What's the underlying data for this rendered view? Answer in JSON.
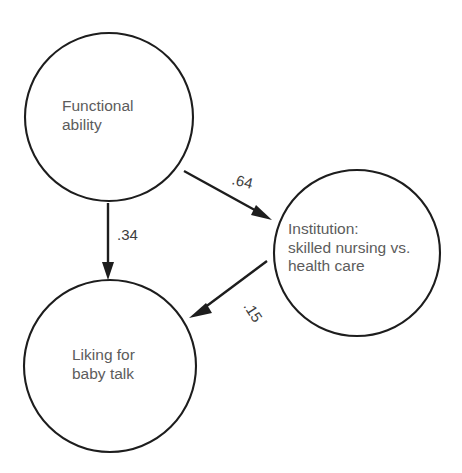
{
  "diagram": {
    "type": "path-diagram",
    "background_color": "#ffffff",
    "node_stroke_color": "#1d1d1d",
    "node_fill_color": "#ffffff",
    "label_color": "#5c5c5c",
    "edge_color": "#1d1d1d",
    "edge_label_color": "#3d3d3d",
    "nodes": [
      {
        "id": "functional-ability",
        "lines": [
          "Functional",
          "ability"
        ],
        "cx": 109,
        "cy": 117,
        "r": 84,
        "text_x": 62,
        "text_y": 111
      },
      {
        "id": "liking-for-baby-talk",
        "lines": [
          "Liking for",
          "baby talk"
        ],
        "cx": 110,
        "cy": 366,
        "r": 86,
        "text_x": 72,
        "text_y": 360
      },
      {
        "id": "institution",
        "lines": [
          "Institution:",
          "skilled nursing vs.",
          "health care"
        ],
        "cx": 357,
        "cy": 253,
        "r": 83,
        "text_x": 288,
        "text_y": 234
      }
    ],
    "edges": [
      {
        "id": "functional-ability-to-institution",
        "from": "functional-ability",
        "to": "institution",
        "coefficient": ".64",
        "x1": 184,
        "y1": 171,
        "x2": 270,
        "y2": 219,
        "label_x": 231,
        "label_y": 184,
        "label_rotation": 14
      },
      {
        "id": "functional-ability-to-liking",
        "from": "functional-ability",
        "to": "liking-for-baby-talk",
        "coefficient": ".34",
        "x1": 108,
        "y1": 203,
        "x2": 108,
        "y2": 279,
        "label_x": 117,
        "label_y": 240,
        "label_rotation": 0
      },
      {
        "id": "institution-to-liking",
        "from": "institution",
        "to": "liking-for-baby-talk",
        "coefficient": ".15",
        "x1": 267,
        "y1": 261,
        "x2": 190,
        "y2": 318,
        "label_x": 243,
        "label_y": 306,
        "label_rotation": 57
      }
    ]
  }
}
